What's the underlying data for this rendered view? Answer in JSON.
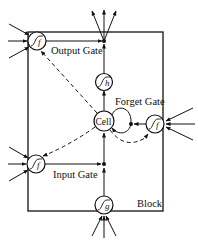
{
  "diagram": {
    "type": "LSTM memory block",
    "colors": {
      "stroke": "#111111",
      "background": "#ffffff"
    },
    "labels": {
      "output_gate": "Output Gate",
      "forget_gate": "Forget Gate",
      "input_gate": "Input Gate",
      "cell": "Cell",
      "block": "Block"
    },
    "nodes": {
      "output_gate_activation": {
        "symbol": "f",
        "icon": "sigmoid-icon"
      },
      "cell_output_activation": {
        "symbol": "h",
        "icon": "sigmoid-icon"
      },
      "forget_gate_activation": {
        "symbol": "f",
        "icon": "sigmoid-icon"
      },
      "input_gate_activation": {
        "symbol": "f",
        "icon": "sigmoid-icon"
      },
      "cell_input_activation": {
        "symbol": "g",
        "icon": "sigmoid-icon"
      }
    },
    "edges": [
      {
        "from": "output_gate_activation",
        "to": "output_multiplier",
        "style": "solid"
      },
      {
        "from": "cell",
        "to": "cell_output_activation",
        "style": "solid"
      },
      {
        "from": "cell_output_activation",
        "to": "output_multiplier",
        "style": "solid"
      },
      {
        "from": "output_multiplier",
        "to": "block_outputs",
        "style": "solid",
        "count": 3
      },
      {
        "from": "cell_input_activation",
        "to": "input_multiplier",
        "style": "solid"
      },
      {
        "from": "input_multiplier",
        "to": "cell",
        "style": "solid"
      },
      {
        "from": "input_gate_activation",
        "to": "input_multiplier",
        "style": "solid"
      },
      {
        "from": "forget_gate_activation",
        "to": "forget_multiplier",
        "style": "solid"
      },
      {
        "from": "cell",
        "to": "forget_multiplier",
        "style": "solid",
        "note": "recurrent loop"
      },
      {
        "from": "cell",
        "to": "output_gate_activation",
        "style": "dashed",
        "note": "peephole"
      },
      {
        "from": "cell",
        "to": "input_gate_activation",
        "style": "dashed",
        "note": "peephole"
      },
      {
        "from": "cell",
        "to": "forget_gate_activation",
        "style": "dashed",
        "note": "peephole"
      }
    ],
    "external_inputs": {
      "output_gate": 3,
      "input_gate": 3,
      "forget_gate": 3,
      "cell_input": 3
    }
  }
}
